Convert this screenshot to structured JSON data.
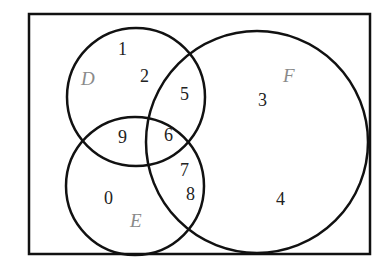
{
  "diagram": {
    "type": "venn",
    "sets": [
      {
        "name": "D",
        "label": "D"
      },
      {
        "name": "E",
        "label": "E"
      },
      {
        "name": "F",
        "label": "F"
      }
    ],
    "regions": {
      "D_only": [
        "1",
        "2"
      ],
      "D_and_F_only": [
        "5"
      ],
      "D_and_E_only": [
        "9"
      ],
      "D_E_F": [
        "6"
      ],
      "E_and_F_only": [
        "7",
        "8"
      ],
      "E_only": [
        "0"
      ],
      "F_only": [
        "3",
        "4"
      ]
    },
    "numbers": {
      "n1": "1",
      "n2": "2",
      "n5": "5",
      "n3": "3",
      "n9": "9",
      "n6": "6",
      "n7": "7",
      "n8": "8",
      "n0": "0",
      "n4": "4"
    }
  }
}
